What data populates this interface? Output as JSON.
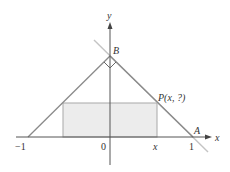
{
  "diagram": {
    "axes": {
      "x_label": "x",
      "y_label": "y"
    },
    "tick_labels": {
      "neg_one": "−1",
      "zero": "0",
      "x": "x",
      "one": "1"
    },
    "points": {
      "B": "B",
      "A": "A",
      "P": "P(x, ?)"
    },
    "colors": {
      "lines": "#8a8a8a",
      "extended_line": "#c4c4c4",
      "rectangle_fill": "#ececec",
      "rectangle_stroke": "#a8a8a8",
      "axes": "#555555"
    },
    "right_angle_marker_at": "B"
  }
}
